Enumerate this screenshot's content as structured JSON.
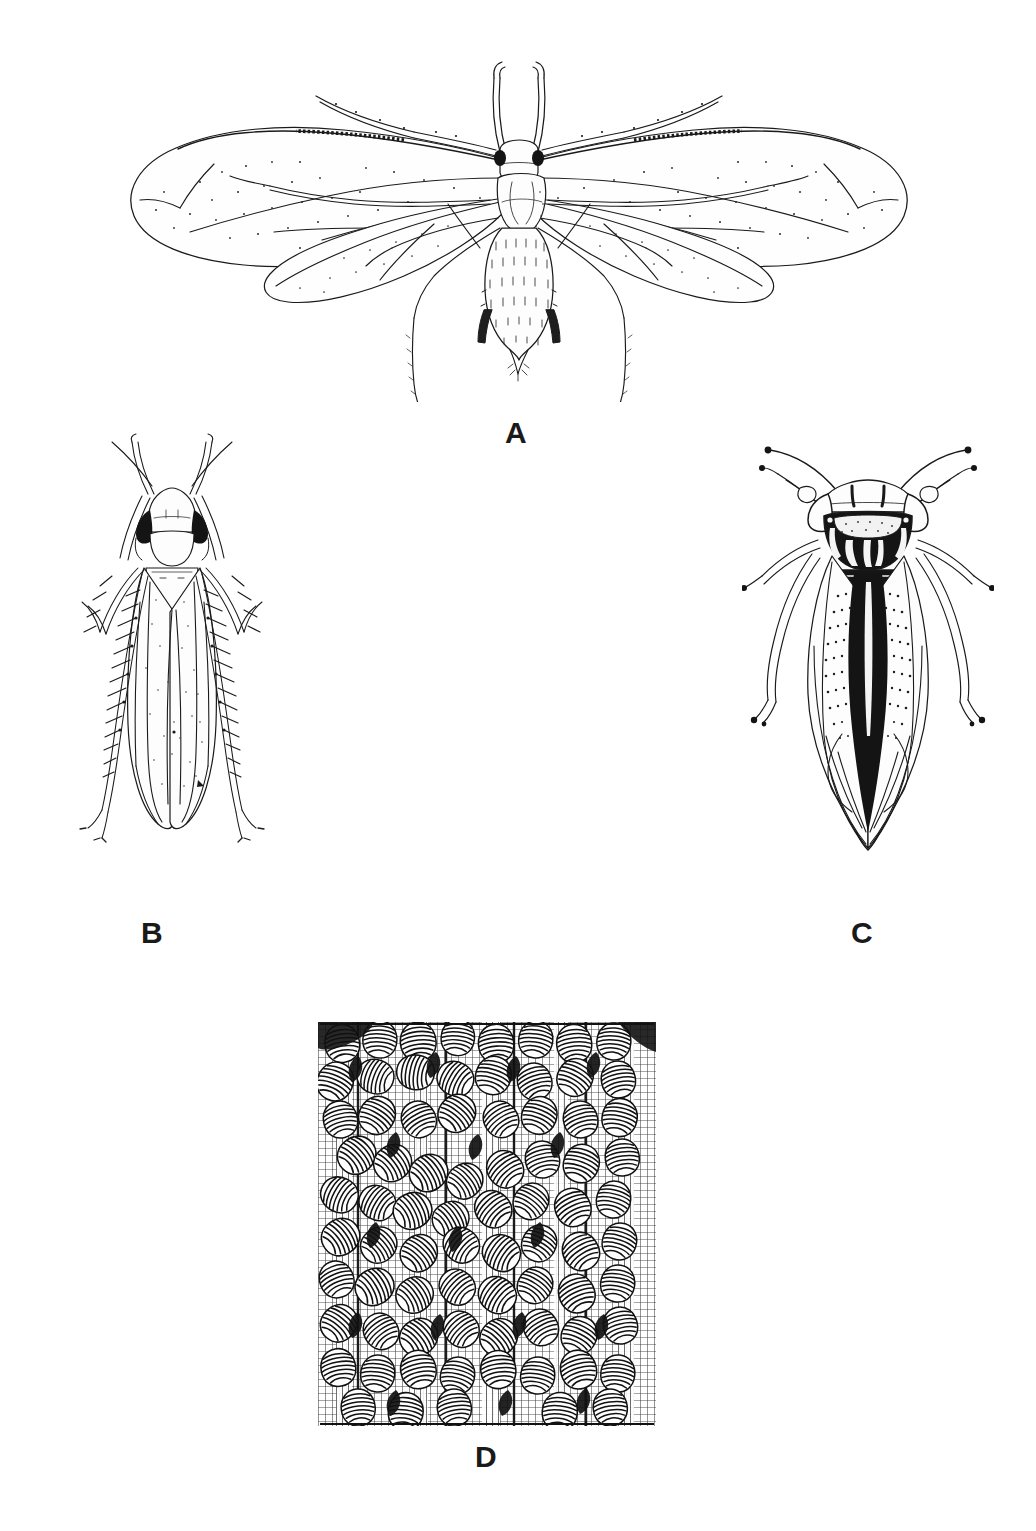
{
  "figure": {
    "type": "scientific-illustration-plate",
    "background_color": "#ffffff",
    "ink_color": "#1a1a1a",
    "panel_count": 4,
    "label_style": "bold-sans-uppercase"
  },
  "panels": [
    {
      "id": "A",
      "label": "A",
      "subject": "winged-aphid-dorsal-view",
      "description": "Alate aphid in dorsal view with two pairs of membranous wings spread laterally, long segmented antennae, dark compound eyes, cornicles and cauda on abdomen",
      "features": [
        "forewing",
        "hindwing",
        "pterostigma",
        "antenna",
        "compound-eye",
        "cornicle",
        "cauda",
        "legs"
      ]
    },
    {
      "id": "B",
      "label": "B",
      "subject": "pale-leafhopper-dorsal-view",
      "description": "Pale stippled leafhopper in dorsal view with dark compound eyes, broad pronotum and spiny hind legs splayed outward",
      "features": [
        "compound-eye",
        "pronotum",
        "scutellum",
        "forewing",
        "spiny-hind-leg",
        "antenna"
      ]
    },
    {
      "id": "C",
      "label": "C",
      "subject": "dark-patterned-leafhopper-dorsal-view",
      "description": "Dark heavily-marked leafhopper in dorsal view with bold black pronotum bearing pale longitudinal stripes, large lateral eyes, curved antennae with dark tips and tapering wings",
      "features": [
        "compound-eye",
        "striped-pronotum",
        "scutellum",
        "forewing",
        "antenna",
        "legs"
      ]
    },
    {
      "id": "D",
      "label": "D",
      "subject": "nymph-colony-on-twig",
      "description": "Dense engraved colony of nymphs clustered over the surface of a twig, rendered with fine hatching and cross-hatched bark texture",
      "features": [
        "nymph-cluster",
        "twig",
        "cross-hatching",
        "bark-texture"
      ]
    }
  ]
}
